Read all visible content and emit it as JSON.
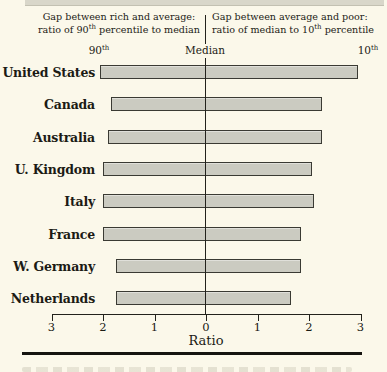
{
  "figure": {
    "header": {
      "left": {
        "line1": "Gap between rich and average:",
        "line2_pre": "ratio of 90",
        "line2_sup": "th",
        "line2_post": " percentile to median"
      },
      "right": {
        "line1": "Gap between average and poor:",
        "line2_pre": "ratio of median to 10",
        "line2_sup": "th",
        "line2_post": " percentile"
      }
    },
    "scale": {
      "left_pre": "90",
      "left_sup": "th",
      "center": "Median",
      "right_pre": "10",
      "right_sup": "th"
    }
  },
  "chart_data": {
    "type": "bar",
    "orientation": "horizontal, diverging from center median line",
    "categories": [
      "United States",
      "Canada",
      "Australia",
      "U. Kingdom",
      "Italy",
      "France",
      "W. Germany",
      "Netherlands"
    ],
    "series": [
      {
        "name": "Gap between rich and average: ratio of 90th percentile to median (extends left of center)",
        "values": [
          2.05,
          1.85,
          1.9,
          2.0,
          2.0,
          2.0,
          1.75,
          1.75
        ]
      },
      {
        "name": "Gap between average and poor: ratio of median to 10th percentile (extends right of center)",
        "values": [
          2.95,
          2.25,
          2.25,
          2.05,
          2.1,
          1.85,
          1.85,
          1.65
        ]
      }
    ],
    "xlabel": "Ratio",
    "x_tick_labels": [
      "3",
      "2",
      "1",
      "0",
      "1",
      "2",
      "3"
    ],
    "x_units_from_center": 3,
    "center_label": "Median",
    "left_end_label": "90th",
    "right_end_label": "10th",
    "grid": false,
    "legend": "none",
    "bar_color": "#cbcbc1",
    "bar_border_color": "#3a3a33",
    "background_color": "#fbf8ea"
  }
}
